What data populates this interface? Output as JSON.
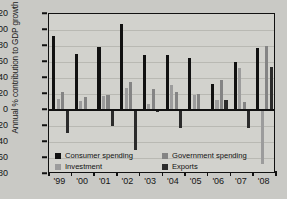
{
  "chart_data": {
    "type": "bar",
    "title": "",
    "xlabel": "",
    "ylabel": "Annual % contribution to GDP growth",
    "ylim": [
      -80,
      120
    ],
    "yticks": [
      120,
      100,
      80,
      60,
      40,
      20,
      0,
      -20,
      -40,
      -60,
      -80
    ],
    "categories": [
      "'99",
      "'00",
      "'01",
      "'02",
      "'03",
      "'04",
      "'05",
      "'06",
      "'07",
      "'08"
    ],
    "grid": true,
    "legend_position": "inside-bottom-left",
    "series": [
      {
        "name": "Consumer spending",
        "color": "#111111",
        "values": [
          92,
          70,
          79,
          108,
          69,
          69,
          65,
          32,
          60,
          77
        ]
      },
      {
        "name": "Investment",
        "color": "#9c9c9c",
        "values": [
          14,
          11,
          17,
          28,
          7,
          31,
          19,
          12,
          53,
          -68
        ]
      },
      {
        "name": "Government spending",
        "color": "#848484",
        "values": [
          22,
          16,
          19,
          35,
          26,
          22,
          20,
          38,
          10,
          80
        ]
      },
      {
        "name": "Exports",
        "color": "#2b2b2b",
        "values": [
          -29,
          -1,
          -20,
          -50,
          -3,
          -23,
          -1,
          13,
          -22,
          54
        ]
      }
    ]
  },
  "legend": {
    "items": [
      {
        "label": "Consumer spending",
        "color": "#111111"
      },
      {
        "label": "Government spending",
        "color": "#848484"
      },
      {
        "label": "Investment",
        "color": "#9c9c9c"
      },
      {
        "label": "Exports",
        "color": "#2b2b2b"
      }
    ]
  }
}
